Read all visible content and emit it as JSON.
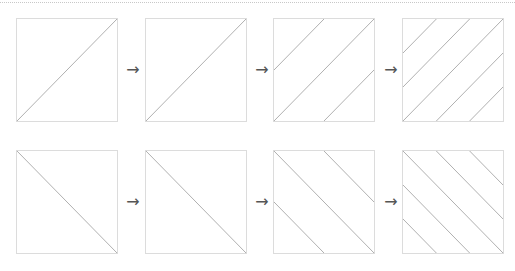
{
  "figure": {
    "line_color": "#a8a8a8",
    "border_color": "#dcdcdc",
    "arrow_glyph": "→",
    "rows": [
      {
        "direction": "ascending",
        "panels": [
          {
            "offsets": [
              0
            ]
          },
          {
            "offsets": [
              -0.5,
              0,
              0.5
            ]
          },
          {
            "offsets": [
              -0.75,
              -0.5,
              -0.25,
              0,
              0.25,
              0.5,
              0.75
            ]
          },
          {
            "offsets": [
              -0.8333,
              -0.6667,
              -0.5,
              -0.3333,
              -0.1667,
              0,
              0.1667,
              0.3333,
              0.5,
              0.6667,
              0.8333
            ]
          }
        ]
      },
      {
        "direction": "descending",
        "panels": [
          {
            "offsets": [
              0
            ]
          },
          {
            "offsets": [
              -0.5,
              0,
              0.5
            ]
          },
          {
            "offsets": [
              -0.75,
              -0.5,
              -0.25,
              0,
              0.25,
              0.5,
              0.75
            ]
          },
          {
            "offsets": [
              -0.8333,
              -0.6667,
              -0.5,
              -0.3333,
              -0.1667,
              0,
              0.1667,
              0.3333,
              0.5,
              0.6667,
              0.8333
            ]
          }
        ]
      }
    ]
  }
}
